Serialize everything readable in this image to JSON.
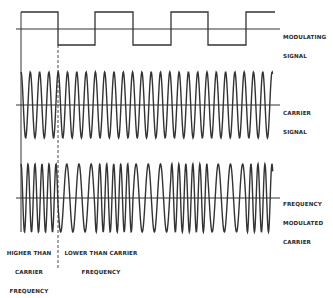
{
  "diagram": {
    "ink_color": "#333333",
    "background": "#ffffff",
    "modulating_signal": {
      "label_lines": [
        "MODULATING",
        "SIGNAL"
      ],
      "baseline_y": 29,
      "high_y": 12,
      "low_y": 45,
      "transitions_x": [
        21,
        58,
        95,
        133,
        171,
        208,
        246
      ],
      "end_x": 275,
      "axis_start_x": 16,
      "axis_end_x": 280
    },
    "carrier_signal": {
      "label_lines": [
        "CARRIER",
        "SIGNAL"
      ],
      "center_y": 105,
      "amplitude": 33,
      "start_x": 21,
      "end_x": 273,
      "period_px": 9.3,
      "axis_start_x": 16,
      "axis_end_x": 280
    },
    "fm_carrier": {
      "label_lines": [
        "FREQUENCY",
        "MODULATED",
        "CARRIER"
      ],
      "center_y": 198,
      "amplitude": 34,
      "start_x": 21,
      "end_x": 273,
      "high_period_px": 7.0,
      "low_period_px": 12.2,
      "axis_start_x": 16,
      "axis_end_x": 280
    },
    "guides": {
      "solid_x": 21,
      "solid_y1": 12,
      "solid_y2": 232,
      "dashed_x": 58,
      "dashed_y1": 45,
      "dashed_y2": 269
    },
    "annotations": {
      "higher": [
        "HIGHER THAN",
        "CARRIER",
        "FREQUENCY"
      ],
      "lower": [
        "LOWER THAN CARRIER",
        "FREQUENCY"
      ]
    }
  }
}
